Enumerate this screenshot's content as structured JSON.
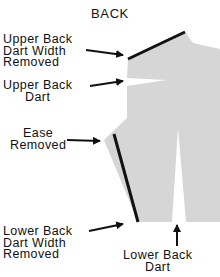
{
  "title": "BACK",
  "labels": {
    "upper_width": "Upper Back\nDart Width\nRemoved",
    "upper_dart": "Upper Back\nDart",
    "ease": "Ease\nRemoved",
    "lower_width": "Lower Back\nDart Width\nRemoved",
    "lower_dart": "Lower Back\nDart"
  },
  "colors": {
    "fill": "#d6d6d6",
    "line": "#111111"
  }
}
